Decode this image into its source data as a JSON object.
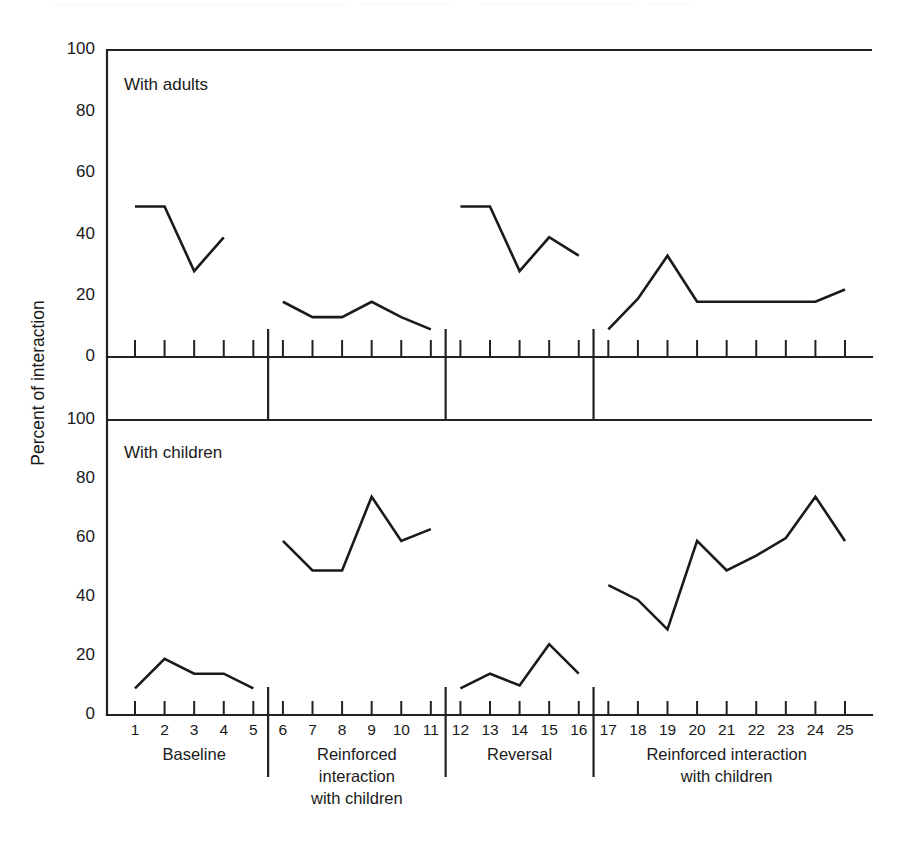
{
  "figure": {
    "y_axis_title": "Percent of interaction",
    "background_color": "#ffffff",
    "line_color": "#1a1a1a"
  },
  "panels": [
    {
      "key": "adults",
      "title": "With adults"
    },
    {
      "key": "children",
      "title": "With children"
    }
  ],
  "axis": {
    "y_ticks": [
      0,
      20,
      40,
      60,
      80,
      100
    ],
    "y_tick_labels": [
      "0",
      "20",
      "40",
      "60",
      "80",
      "100"
    ],
    "x_tick_labels": [
      "1",
      "2",
      "3",
      "4",
      "5",
      "6",
      "7",
      "8",
      "9",
      "10",
      "11",
      "12",
      "13",
      "14",
      "15",
      "16",
      "17",
      "18",
      "19",
      "20",
      "21",
      "22",
      "23",
      "24",
      "25"
    ]
  },
  "phases": [
    {
      "name": "Baseline",
      "lines": [
        "Baseline"
      ],
      "start": 1,
      "end": 5
    },
    {
      "name": "Reinforced interaction with children",
      "lines": [
        "Reinforced",
        "interaction",
        "with children"
      ],
      "start": 6,
      "end": 11
    },
    {
      "name": "Reversal",
      "lines": [
        "Reversal"
      ],
      "start": 12,
      "end": 16
    },
    {
      "name": "Reinforced interaction with children",
      "lines": [
        "Reinforced interaction",
        "with children"
      ],
      "start": 17,
      "end": 25
    }
  ],
  "phase_dividers": [
    5.5,
    11.5,
    16.5
  ],
  "chart_data": {
    "type": "line",
    "title": "",
    "xlabel": "",
    "ylabel": "Percent of interaction",
    "xlim": [
      1,
      25
    ],
    "ylim": [
      0,
      100
    ],
    "grid": false,
    "legend": "none",
    "x": [
      1,
      2,
      3,
      4,
      5,
      6,
      7,
      8,
      9,
      10,
      11,
      12,
      13,
      14,
      15,
      16,
      17,
      18,
      19,
      20,
      21,
      22,
      23,
      24,
      25
    ],
    "series": [
      {
        "name": "With adults",
        "panel": "adults",
        "segments": [
          {
            "phase": "Baseline",
            "x": [
              1,
              2,
              3,
              4,
              5
            ],
            "values": [
              49,
              49,
              28,
              39,
              null
            ]
          },
          {
            "phase": "Reinforced interaction with children",
            "x": [
              6,
              7,
              8,
              9,
              10,
              11
            ],
            "values": [
              18,
              13,
              13,
              18,
              13,
              9
            ]
          },
          {
            "phase": "Reversal",
            "x": [
              12,
              13,
              14,
              15,
              16
            ],
            "values": [
              49,
              49,
              28,
              39,
              33
            ]
          },
          {
            "phase": "Reinforced interaction with children",
            "x": [
              17,
              18,
              19,
              20,
              21,
              22,
              23,
              24,
              25
            ],
            "values": [
              9,
              19,
              33,
              18,
              18,
              18,
              18,
              18,
              22
            ]
          }
        ]
      },
      {
        "name": "With children",
        "panel": "children",
        "segments": [
          {
            "phase": "Baseline",
            "x": [
              1,
              2,
              3,
              4,
              5
            ],
            "values": [
              9,
              19,
              14,
              14,
              9
            ]
          },
          {
            "phase": "Reinforced interaction with children",
            "x": [
              6,
              7,
              8,
              9,
              10,
              11
            ],
            "values": [
              59,
              49,
              49,
              74,
              59,
              63
            ]
          },
          {
            "phase": "Reversal",
            "x": [
              12,
              13,
              14,
              15,
              16
            ],
            "values": [
              9,
              14,
              10,
              24,
              14
            ]
          },
          {
            "phase": "Reinforced interaction with children",
            "x": [
              17,
              18,
              19,
              20,
              21,
              22,
              23,
              24,
              25
            ],
            "values": [
              44,
              39,
              29,
              59,
              49,
              54,
              60,
              74,
              59
            ]
          }
        ]
      }
    ]
  }
}
